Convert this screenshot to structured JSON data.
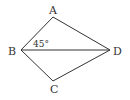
{
  "diagram": {
    "type": "quadrilateral-with-diagonal",
    "stroke_color": "#333333",
    "points": {
      "A": {
        "label": "A",
        "x": 53,
        "y": 17
      },
      "B": {
        "label": "B",
        "x": 21,
        "y": 50
      },
      "C": {
        "label": "C",
        "x": 53,
        "y": 81
      },
      "D": {
        "label": "D",
        "x": 110,
        "y": 50
      }
    },
    "segments": [
      "AB",
      "AD",
      "BC",
      "CD",
      "BD"
    ],
    "angle_label": "45°",
    "angle_at": "B",
    "angle_between": [
      "BA",
      "BD"
    ]
  }
}
